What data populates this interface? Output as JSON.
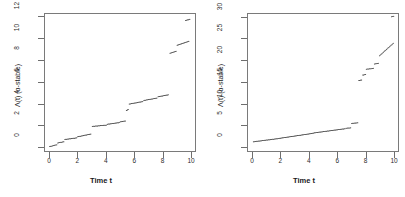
{
  "figure": {
    "background": "#ffffff",
    "panel_count": 2,
    "point_color": "#333333"
  },
  "chart_data": [
    {
      "type": "scatter",
      "panel": "left",
      "title": "",
      "xlabel": "Time t",
      "ylabel": "Λ(t) (α-stable)",
      "xlim": [
        -0.35,
        10.35
      ],
      "ylim": [
        -0.45,
        12.3
      ],
      "xticks": [
        0,
        2,
        4,
        6,
        8,
        10
      ],
      "xticklabels": [
        "0",
        "2",
        "4",
        "6",
        "8",
        "10"
      ],
      "yticks": [
        0,
        2,
        4,
        6,
        8,
        10,
        12
      ],
      "yticklabels": [
        "0",
        "2",
        "4",
        "6",
        "8",
        "10",
        "12"
      ],
      "grid": false,
      "legend": null,
      "description": "Increasing pure-jump subordinator sample path drawn as dense small dots; near-flat creeping runs separated by vertical jumps.",
      "segments": [
        {
          "x0": 0.05,
          "y0": 0.05,
          "x1": 0.55,
          "y1": 0.22
        },
        {
          "x0": 0.62,
          "y0": 0.38,
          "x1": 1.05,
          "y1": 0.5
        },
        {
          "x0": 1.12,
          "y0": 0.7,
          "x1": 1.95,
          "y1": 0.85
        },
        {
          "x0": 2.02,
          "y0": 0.95,
          "x1": 2.95,
          "y1": 1.2
        },
        {
          "x0": 3.05,
          "y0": 1.9,
          "x1": 4.05,
          "y1": 2.02
        },
        {
          "x0": 4.12,
          "y0": 2.1,
          "x1": 4.95,
          "y1": 2.25
        },
        {
          "x0": 5.02,
          "y0": 2.32,
          "x1": 5.38,
          "y1": 2.4
        },
        {
          "x0": 5.45,
          "y0": 3.35,
          "x1": 5.58,
          "y1": 3.45
        },
        {
          "x0": 5.65,
          "y0": 3.95,
          "x1": 6.6,
          "y1": 4.18
        },
        {
          "x0": 6.68,
          "y0": 4.28,
          "x1": 7.6,
          "y1": 4.5
        },
        {
          "x0": 7.68,
          "y0": 4.62,
          "x1": 8.4,
          "y1": 4.8
        },
        {
          "x0": 8.52,
          "y0": 8.6,
          "x1": 8.95,
          "y1": 8.8
        },
        {
          "x0": 9.02,
          "y0": 9.35,
          "x1": 9.85,
          "y1": 9.72
        },
        {
          "x0": 9.62,
          "y0": 11.62,
          "x1": 9.92,
          "y1": 11.72
        }
      ]
    },
    {
      "type": "scatter",
      "panel": "right",
      "title": "",
      "xlabel": "Time t",
      "ylabel": "Λ(t) (α-stable)",
      "xlim": [
        -0.35,
        10.35
      ],
      "ylim": [
        -1.1,
        30.8
      ],
      "xticks": [
        0,
        2,
        4,
        6,
        8,
        10
      ],
      "xticklabels": [
        "0",
        "2",
        "4",
        "6",
        "8",
        "10"
      ],
      "yticks": [
        0,
        5,
        10,
        15,
        20,
        25,
        30
      ],
      "yticklabels": [
        "0",
        "5",
        "10",
        "15",
        "20",
        "25",
        "30"
      ],
      "grid": false,
      "legend": null,
      "description": "Second realisation of the same subordinator on a larger vertical scale; slow drift to ~5 then a large jump near t=7.5 and a final jump to ~30.",
      "segments": [
        {
          "x0": 0.1,
          "y0": 1.25,
          "x1": 2.0,
          "y1": 2.05
        },
        {
          "x0": 2.05,
          "y0": 2.1,
          "x1": 4.3,
          "y1": 3.2
        },
        {
          "x0": 4.35,
          "y0": 3.28,
          "x1": 6.55,
          "y1": 4.25
        },
        {
          "x0": 6.62,
          "y0": 4.35,
          "x1": 6.95,
          "y1": 4.45
        },
        {
          "x0": 7.02,
          "y0": 5.45,
          "x1": 7.45,
          "y1": 5.62
        },
        {
          "x0": 7.52,
          "y0": 15.3,
          "x1": 7.72,
          "y1": 15.45
        },
        {
          "x0": 7.8,
          "y0": 16.55,
          "x1": 8.0,
          "y1": 16.7
        },
        {
          "x0": 8.05,
          "y0": 17.9,
          "x1": 8.55,
          "y1": 18.1
        },
        {
          "x0": 8.62,
          "y0": 19.1,
          "x1": 8.9,
          "y1": 19.25
        },
        {
          "x0": 8.98,
          "y0": 21.0,
          "x1": 9.95,
          "y1": 23.85
        },
        {
          "x0": 9.82,
          "y0": 29.95,
          "x1": 9.98,
          "y1": 30.05
        }
      ]
    }
  ]
}
